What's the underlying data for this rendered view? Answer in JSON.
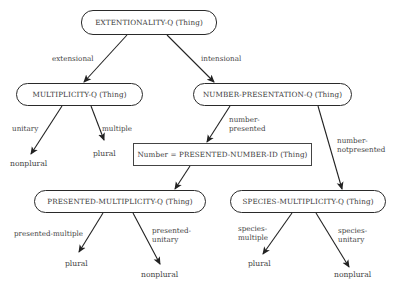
{
  "nodes": {
    "root": "EXTENTIONALITY-Q (Thing)",
    "multiplicity": "MULTIPLICITY-Q (Thing)",
    "number_presentation": "NUMBER-PRESENTATION-Q (Thing)",
    "number_id": "Number = PRESENTED-NUMBER-ID (Thing)",
    "presented_multiplicity": "PRESENTED-MULTIPLICITY-Q (Thing)",
    "species_multiplicity": "SPECIES-MULTIPLICITY-Q (Thing)"
  },
  "edges": {
    "extensional": "extensional",
    "intensional": "intensional",
    "unitary": "unitary",
    "multiple": "multiple",
    "number_presented_1": "number-",
    "number_presented_2": "presented",
    "number_notpresented_1": "number-",
    "number_notpresented_2": "notpresented",
    "presented_multiple": "presented-multiple",
    "presented_unitary_1": "presented-",
    "presented_unitary_2": "unitary",
    "species_multiple_1": "species-",
    "species_multiple_2": "multiple",
    "species_unitary_1": "species-",
    "species_unitary_2": "unitary"
  },
  "leaves": {
    "mult_nonplural": "nonplural",
    "mult_plural": "plural",
    "pres_plural": "plural",
    "pres_nonplural": "nonplural",
    "spec_plural": "plural",
    "spec_nonplural": "nonplural"
  },
  "colors": {
    "line": "#222222",
    "text": "#3a3a3a",
    "background": "#ffffff"
  }
}
